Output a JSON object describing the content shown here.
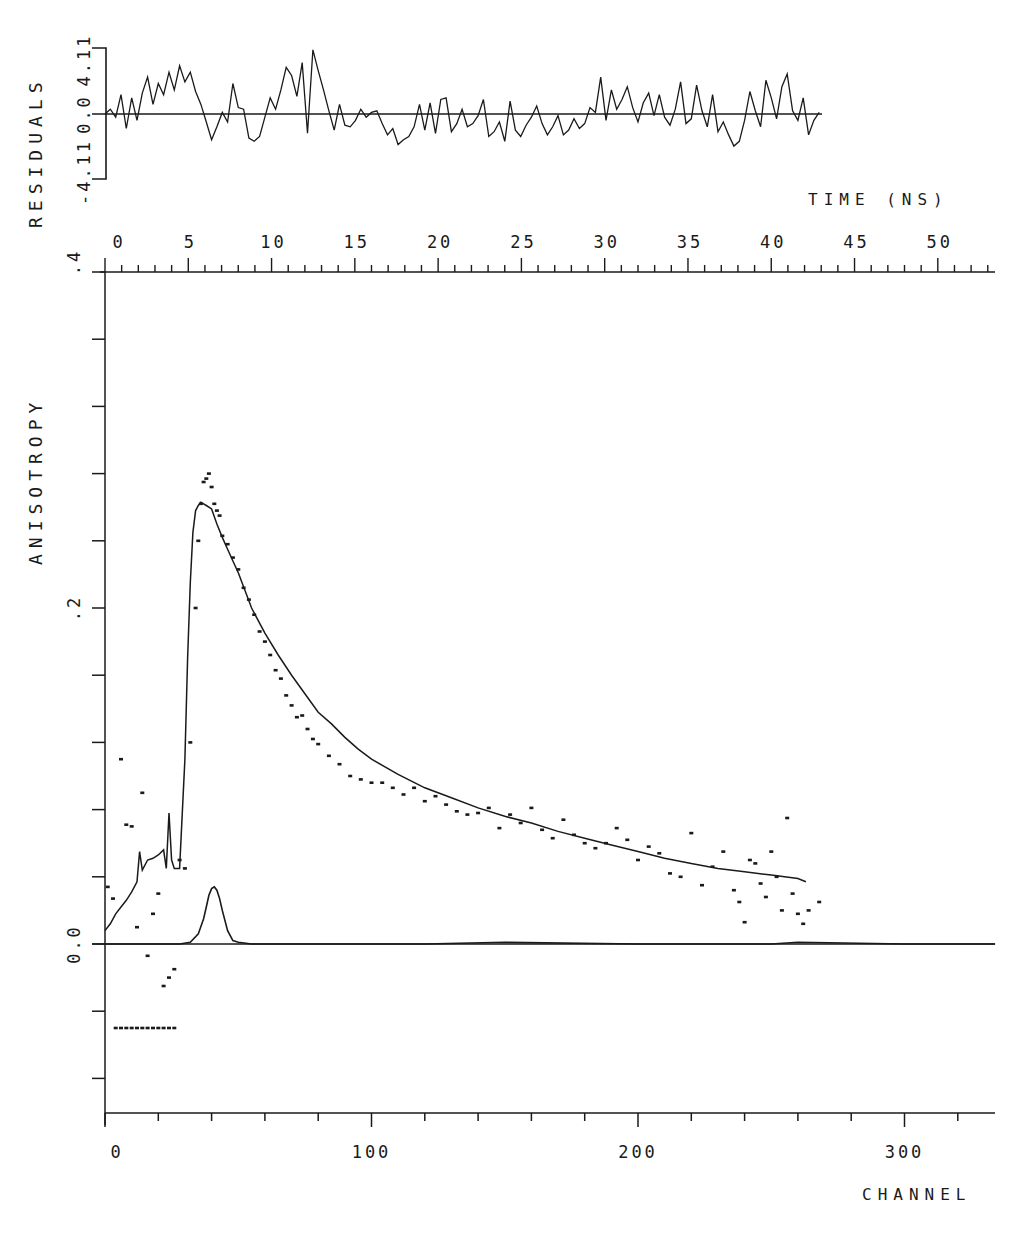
{
  "chart_data": [
    {
      "panel": "residuals",
      "type": "line",
      "ylabel": "RESIDUALS",
      "yticks": [
        "-4.11",
        "0.0",
        "4.11"
      ],
      "ylim": [
        -4.11,
        4.11
      ],
      "x_unit": "channel",
      "xlim": [
        0,
        268
      ],
      "zero_line": true,
      "x": [
        0,
        2,
        4,
        6,
        8,
        10,
        12,
        14,
        16,
        18,
        20,
        22,
        24,
        26,
        28,
        30,
        32,
        34,
        36,
        38,
        40,
        42,
        44,
        46,
        48,
        50,
        52,
        54,
        56,
        58,
        60,
        62,
        64,
        66,
        68,
        70,
        72,
        74,
        76,
        78,
        80,
        82,
        84,
        86,
        88,
        90,
        92,
        94,
        96,
        98,
        100,
        102,
        104,
        106,
        108,
        110,
        112,
        114,
        116,
        118,
        120,
        122,
        124,
        126,
        128,
        130,
        132,
        134,
        136,
        138,
        140,
        142,
        144,
        146,
        148,
        150,
        152,
        154,
        156,
        158,
        160,
        162,
        164,
        166,
        168,
        170,
        172,
        174,
        176,
        178,
        180,
        182,
        184,
        186,
        188,
        190,
        192,
        194,
        196,
        198,
        200,
        202,
        204,
        206,
        208,
        210,
        212,
        214,
        216,
        218,
        220,
        222,
        224,
        226,
        228,
        230,
        232,
        234,
        236,
        238,
        240,
        242,
        244,
        246,
        248,
        250,
        252,
        254,
        256,
        258,
        260,
        262,
        264,
        266,
        268
      ],
      "values": [
        0.0,
        0.3,
        -0.2,
        1.2,
        -0.9,
        1.0,
        -0.4,
        1.3,
        2.3,
        0.6,
        1.9,
        1.2,
        2.6,
        1.5,
        3.0,
        2.0,
        2.6,
        1.4,
        0.6,
        -0.5,
        -1.6,
        -0.8,
        0.1,
        -0.5,
        1.9,
        0.4,
        0.3,
        -1.5,
        -1.7,
        -1.4,
        -0.2,
        1.0,
        0.3,
        1.5,
        2.9,
        2.4,
        1.1,
        3.2,
        -1.2,
        4.0,
        2.7,
        1.5,
        0.2,
        -1.0,
        0.6,
        -0.7,
        -0.8,
        -0.4,
        0.3,
        -0.2,
        0.1,
        0.2,
        -0.6,
        -1.3,
        -0.9,
        -1.9,
        -1.6,
        -1.4,
        -0.8,
        0.6,
        -1.0,
        0.7,
        -1.2,
        0.9,
        1.0,
        -1.1,
        -0.6,
        0.3,
        -0.8,
        -0.6,
        -0.1,
        0.9,
        -1.4,
        -1.1,
        -0.5,
        -1.7,
        0.8,
        -1.0,
        -1.4,
        -0.7,
        -0.2,
        0.5,
        -0.6,
        -1.3,
        -0.8,
        -0.1,
        -1.3,
        -1.0,
        -0.3,
        -0.9,
        -0.6,
        0.4,
        0.1,
        2.3,
        -0.4,
        1.5,
        0.3,
        0.9,
        1.7,
        0.4,
        -0.5,
        0.7,
        1.3,
        -0.1,
        1.2,
        -0.2,
        -0.7,
        0.3,
        2.0,
        -0.6,
        -0.3,
        1.8,
        0.2,
        -0.8,
        1.2,
        -1.1,
        -0.5,
        -1.3,
        -2.0,
        -1.7,
        -0.4,
        1.4,
        0.2,
        -0.8,
        2.1,
        1.0,
        -0.3,
        1.7,
        2.5,
        0.2,
        -0.4,
        1.0,
        -1.3,
        -0.4,
        0.1
      ]
    },
    {
      "panel": "anisotropy",
      "type": "scatter",
      "title": "",
      "xlabel": "CHANNEL",
      "ylabel": "ANISOTROPY",
      "xlim": [
        0,
        334
      ],
      "ylim": [
        -0.1,
        0.4
      ],
      "xticks": [
        0,
        100,
        200,
        300
      ],
      "xminor_step": 20,
      "yticks": [
        0.0,
        0.2,
        0.4
      ],
      "ytick_labels": [
        "0.0",
        ".2",
        ".4"
      ],
      "yminor_step": 0.04,
      "top_axis": {
        "label": "TIME (NS)",
        "ticks": [
          0,
          5,
          10,
          15,
          20,
          25,
          30,
          35,
          40,
          45,
          50
        ],
        "minor_step": 1,
        "ns_per_channel": 0.16,
        "xlim_ns": [
          0,
          53.4
        ]
      },
      "grid": false,
      "series": [
        {
          "name": "data (dots)",
          "style": "dots",
          "x": [
            1,
            3,
            6,
            8,
            10,
            12,
            14,
            16,
            18,
            20,
            22,
            24,
            26,
            28,
            30,
            32,
            34,
            35,
            36,
            37,
            38,
            39,
            40,
            41,
            42,
            43,
            44,
            46,
            48,
            50,
            52,
            54,
            56,
            58,
            60,
            62,
            64,
            66,
            68,
            70,
            72,
            74,
            76,
            78,
            80,
            84,
            88,
            92,
            96,
            100,
            104,
            108,
            112,
            116,
            120,
            124,
            128,
            132,
            136,
            140,
            144,
            148,
            152,
            156,
            160,
            164,
            168,
            172,
            176,
            180,
            184,
            188,
            192,
            196,
            200,
            204,
            208,
            212,
            216,
            220,
            224,
            228,
            232,
            236,
            238,
            240,
            242,
            244,
            246,
            248,
            250,
            252,
            254,
            256,
            258,
            260,
            262,
            264,
            268
          ],
          "values": [
            0.034,
            0.027,
            0.11,
            0.071,
            0.07,
            0.01,
            0.09,
            -0.007,
            0.018,
            0.03,
            -0.025,
            -0.02,
            -0.015,
            0.05,
            0.045,
            0.12,
            0.2,
            0.24,
            0.262,
            0.275,
            0.277,
            0.28,
            0.272,
            0.262,
            0.258,
            0.255,
            0.243,
            0.238,
            0.23,
            0.223,
            0.212,
            0.205,
            0.196,
            0.186,
            0.18,
            0.172,
            0.163,
            0.158,
            0.148,
            0.142,
            0.135,
            0.136,
            0.128,
            0.122,
            0.119,
            0.112,
            0.107,
            0.1,
            0.098,
            0.096,
            0.096,
            0.093,
            0.089,
            0.093,
            0.085,
            0.088,
            0.083,
            0.079,
            0.077,
            0.078,
            0.081,
            0.069,
            0.077,
            0.072,
            0.081,
            0.068,
            0.063,
            0.074,
            0.065,
            0.06,
            0.057,
            0.06,
            0.069,
            0.062,
            0.05,
            0.058,
            0.054,
            0.042,
            0.04,
            0.066,
            0.035,
            0.046,
            0.055,
            0.032,
            0.025,
            0.013,
            0.05,
            0.048,
            0.036,
            0.028,
            0.055,
            0.04,
            0.02,
            0.075,
            0.03,
            0.018,
            0.012,
            0.02,
            0.025
          ]
        },
        {
          "name": "data (low dots)",
          "style": "dots",
          "x": [
            4,
            6,
            8,
            10,
            12,
            14,
            16,
            18,
            20,
            22,
            24,
            26
          ],
          "values": [
            -0.05,
            -0.05,
            -0.05,
            -0.05,
            -0.05,
            -0.05,
            -0.05,
            -0.05,
            -0.05,
            -0.05,
            -0.05,
            -0.05
          ]
        },
        {
          "name": "fit",
          "style": "line",
          "x": [
            0,
            2,
            4,
            6,
            8,
            10,
            12,
            13,
            14,
            16,
            18,
            20,
            22,
            23,
            24,
            25,
            26,
            28,
            30,
            31,
            32,
            33,
            34,
            35,
            36,
            37,
            38,
            40,
            42,
            44,
            46,
            48,
            50,
            55,
            60,
            65,
            70,
            75,
            80,
            85,
            90,
            95,
            100,
            110,
            120,
            130,
            140,
            150,
            160,
            170,
            180,
            190,
            200,
            210,
            220,
            230,
            240,
            250,
            255,
            260,
            263
          ],
          "values": [
            0.008,
            0.012,
            0.018,
            0.022,
            0.026,
            0.031,
            0.037,
            0.055,
            0.044,
            0.05,
            0.051,
            0.053,
            0.056,
            0.045,
            0.078,
            0.05,
            0.045,
            0.045,
            0.11,
            0.17,
            0.215,
            0.245,
            0.258,
            0.261,
            0.263,
            0.262,
            0.261,
            0.259,
            0.25,
            0.242,
            0.235,
            0.228,
            0.221,
            0.2,
            0.185,
            0.172,
            0.16,
            0.149,
            0.138,
            0.131,
            0.123,
            0.116,
            0.11,
            0.101,
            0.093,
            0.087,
            0.081,
            0.076,
            0.072,
            0.067,
            0.063,
            0.059,
            0.055,
            0.051,
            0.048,
            0.045,
            0.043,
            0.041,
            0.04,
            0.039,
            0.037
          ]
        },
        {
          "name": "instrument response",
          "style": "dashed-peak",
          "x": [
            0,
            20,
            28,
            32,
            35,
            37,
            38,
            39,
            40,
            41,
            42,
            43,
            44,
            46,
            48,
            50,
            55,
            60,
            80,
            120,
            150,
            200,
            250,
            260,
            300,
            334
          ],
          "values": [
            0,
            0,
            0,
            0.001,
            0.006,
            0.015,
            0.022,
            0.029,
            0.033,
            0.034,
            0.032,
            0.027,
            0.02,
            0.008,
            0.002,
            0.001,
            0,
            0,
            0,
            0,
            0.001,
            0,
            0,
            0.001,
            0,
            0
          ]
        }
      ]
    }
  ],
  "labels": {
    "residuals_axis": "RESIDUALS",
    "residual_top": "4.11",
    "residual_zero": "0.0",
    "residual_bottom": "-4.11",
    "time_axis": "TIME (NS)",
    "anisotropy_axis": "ANISOTROPY",
    "y_top": ".4",
    "y_mid": ".2",
    "y_zero": "0.0",
    "channel_axis": "CHANNEL"
  }
}
